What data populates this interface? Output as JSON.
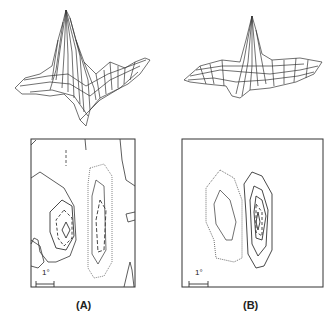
{
  "panels": [
    {
      "id": "A",
      "label": "(A)",
      "scale_bar_label": "1°",
      "surface": "3D mesh surface with tall positive peak and adjacent negative trough",
      "contour": "Contour map: solid and dashed contours (negative lobe left, dotted/dashed positive lobe right)"
    },
    {
      "id": "B",
      "label": "(B)",
      "scale_bar_label": "1°",
      "surface": "3D mesh surface with narrow positive peak on flat plane, small negative dip",
      "contour": "Contour map: dotted contours on left lobe, solid/dashed concentric contours on right lobe"
    }
  ],
  "colors": {
    "line": "#333333",
    "background": "#ffffff"
  }
}
